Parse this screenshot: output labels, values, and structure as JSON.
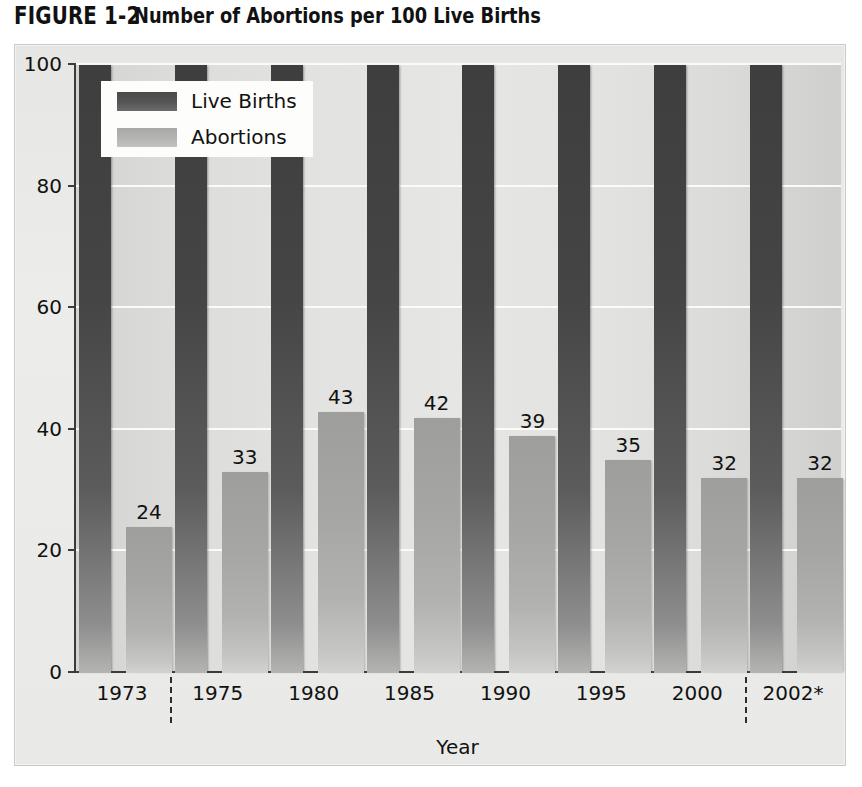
{
  "figure": {
    "label": "FIGURE 1-2",
    "caption": "Number of Abortions per 100 Live Births"
  },
  "legend": {
    "position": "top-left-inside",
    "items": [
      {
        "label": "Live Births",
        "color": "#4a4a4a",
        "swatch": "live-births-swatch"
      },
      {
        "label": "Abortions",
        "color": "#b0b0ae",
        "swatch": "abortions-swatch"
      }
    ]
  },
  "chart_data": {
    "type": "bar",
    "title": "Number of Abortions per 100 Live Births",
    "subtitle": "",
    "xlabel": "Year",
    "ylabel": "",
    "categories": [
      "1973",
      "1975",
      "1980",
      "1985",
      "1990",
      "1995",
      "2000",
      "2002*"
    ],
    "series": [
      {
        "name": "Live Births",
        "color": "#4a4a4a",
        "values": [
          100,
          100,
          100,
          100,
          100,
          100,
          100,
          100
        ]
      },
      {
        "name": "Abortions",
        "color": "#b0b0ae",
        "values": [
          24,
          33,
          43,
          42,
          39,
          35,
          32,
          32
        ]
      }
    ],
    "value_labels": [
      "24",
      "33",
      "43",
      "42",
      "39",
      "35",
      "32",
      "32"
    ],
    "ylim": [
      0,
      100
    ],
    "yticks": [
      0,
      20,
      40,
      60,
      80,
      100
    ],
    "ytick_labels": [
      "0",
      "20",
      "40",
      "60",
      "80",
      "100"
    ],
    "grid": true,
    "grid_color": "#fbfbfa",
    "legend_position": "upper left",
    "category_separators": [
      "after-1973",
      "after-2000"
    ],
    "footnote_marker": "*"
  },
  "axes": {
    "y_tick_labels": [
      "100",
      "80",
      "60",
      "40",
      "20",
      "0"
    ],
    "x_tick_labels": [
      "1973",
      "1975",
      "1980",
      "1985",
      "1990",
      "1995",
      "2000",
      "2002*"
    ],
    "x_axis_title": "Year"
  }
}
